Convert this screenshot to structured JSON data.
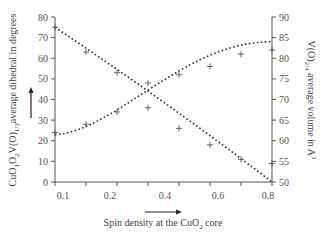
{
  "chart_data": {
    "type": "scatter",
    "title": "",
    "xlabel": "Spin density at the CuO2 core",
    "ylabel_left": "CuO1O2V(O)1/3average dihedral in degrees",
    "ylabel_right": "V(O)2/4 average volume in A3",
    "x_ticks": [
      0.1,
      0.2,
      0.3,
      0.4,
      0.5,
      0.6,
      0.7,
      0.8
    ],
    "x_tick_labels": [
      "0.1",
      "0.2",
      "0.4",
      "0.6",
      "0.8"
    ],
    "xlim": [
      0.1,
      0.8
    ],
    "ylim_left": [
      0,
      80
    ],
    "ylim_right": [
      50,
      90
    ],
    "y_left_ticks": [
      0,
      10,
      20,
      30,
      40,
      50,
      60,
      70,
      80
    ],
    "y_right_ticks": [
      50,
      55,
      60,
      65,
      70,
      75,
      80,
      85,
      90
    ],
    "grid": false,
    "legend": "none",
    "series": [
      {
        "name": "CuO1O2V(O)1/3 average dihedral",
        "axis": "left",
        "marker": "+",
        "x": [
          0.1,
          0.2,
          0.3,
          0.4,
          0.5,
          0.6,
          0.7,
          0.8
        ],
        "values": [
          75,
          63,
          53,
          48,
          26,
          18,
          11,
          9
        ],
        "trend": "dotted decreasing fit from 75 at 0.1 to 0 at 0.8"
      },
      {
        "name": "V(O)2/4 average volume",
        "axis": "right",
        "marker": "+",
        "x": [
          0.1,
          0.2,
          0.3,
          0.4,
          0.5,
          0.6,
          0.7,
          0.8
        ],
        "values": [
          62,
          64,
          67,
          68,
          76,
          78,
          81,
          82
        ],
        "trend": "dotted increasing fit from 61.5 at 0.1 to 84 at 0.8"
      }
    ]
  },
  "labels": {
    "xlabel_prefix": "Spin density at the CuO",
    "xlabel_sub": "2",
    "xlabel_suffix": " core",
    "ylabel_left_parts": [
      "CuO",
      "1",
      "O",
      "2",
      "V(O)",
      "1/3",
      "average dihedral in degrees"
    ],
    "ylabel_right_parts": [
      "V(O)",
      "2/4",
      " average volume in A",
      "3"
    ]
  }
}
